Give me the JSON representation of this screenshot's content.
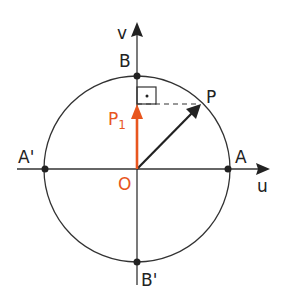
{
  "diagram": {
    "labels": {
      "v_axis": "v",
      "u_axis": "u",
      "B": "B",
      "B_prime": "B'",
      "A": "A",
      "A_prime": "A'",
      "P": "P",
      "P1": "P",
      "P1_sub": "1",
      "O": "O",
      "right_angle_dot": "·"
    },
    "colors": {
      "line": "#222222",
      "accent": "#e8561e"
    },
    "geometry": {
      "center": [
        137,
        169
      ],
      "radius": 93,
      "P": [
        201,
        104
      ],
      "P1": [
        137,
        104
      ]
    }
  }
}
